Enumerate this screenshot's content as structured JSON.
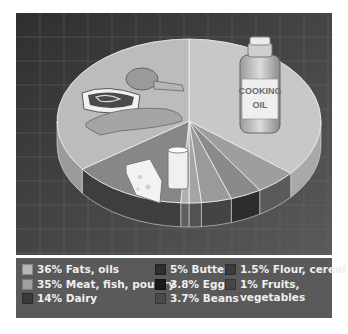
{
  "chart_data": {
    "type": "pie",
    "style": "3d-exploded-pie-with-illustrations",
    "title": "",
    "slices": [
      {
        "label": "Fats, oils",
        "display": "36% Fats, oils",
        "value": 36,
        "color": "#c8c8c8",
        "side": "#a9a9a9",
        "start": -90,
        "end": 39.6
      },
      {
        "label": "Butter",
        "display": "5% Butter",
        "value": 5,
        "color": "#9e9e9e",
        "side": "#5a5a5a",
        "start": 39.6,
        "end": 57.6
      },
      {
        "label": "Eggs",
        "display": "3.8% Eggs",
        "value": 3.8,
        "color": "#8a8a8a",
        "side": "#2d2d2d",
        "start": 57.6,
        "end": 71.3
      },
      {
        "label": "Beans",
        "display": "3.7% Beans",
        "value": 3.7,
        "color": "#9a9a9a",
        "side": "#444444",
        "start": 71.3,
        "end": 84.6
      },
      {
        "label": "Flour, cereal",
        "display": "1.5% Flour, cereal",
        "value": 1.5,
        "color": "#a4a4a4",
        "side": "#525252",
        "start": 84.6,
        "end": 90
      },
      {
        "label": "Fruits, vegetables",
        "display": "1% Fruits,\nvegetables",
        "value": 1,
        "color": "#b0b0b0",
        "side": "#606060",
        "start": 90,
        "end": 93.6
      },
      {
        "label": "Dairy",
        "display": "14% Dairy",
        "value": 14,
        "color": "#878787",
        "side": "#3e3e3e",
        "start": 93.6,
        "end": 144
      },
      {
        "label": "Meat, fish, poultry",
        "display": "35% Meat, fish, poultry",
        "value": 35,
        "color": "#bcbcbc",
        "side": "#9a9a9a",
        "start": 144,
        "end": 270
      }
    ],
    "total": 100,
    "unit": "%",
    "legend_position": "bottom",
    "grid": true,
    "illustrations": [
      "cooking-oil-bottle",
      "steak",
      "chicken-leg",
      "fish",
      "cheese-wedge",
      "glass-of-milk"
    ]
  },
  "illustration": {
    "bottle_label_line1": "COOKING",
    "bottle_label_line2": "OIL"
  },
  "legend": {
    "columns": [
      [
        {
          "label": "36% Fats, oils",
          "color": "#b7b7b7"
        },
        {
          "label": "35% Meat, fish, poultry",
          "color": "#a0a0a0"
        },
        {
          "label": "14% Dairy",
          "color": "#3a3a3a"
        }
      ],
      [
        {
          "label": "5% Butter",
          "color": "#2e2e2e"
        },
        {
          "label": "3.8% Eggs",
          "color": "#1a1a1a"
        },
        {
          "label": "3.7% Beans",
          "color": "#4a4a4a"
        }
      ],
      [
        {
          "label": "1.5% Flour, cereal",
          "color": "#3c3c3c"
        },
        {
          "label": "1% Fruits,\nvegetables",
          "color": "#464646"
        }
      ]
    ]
  }
}
